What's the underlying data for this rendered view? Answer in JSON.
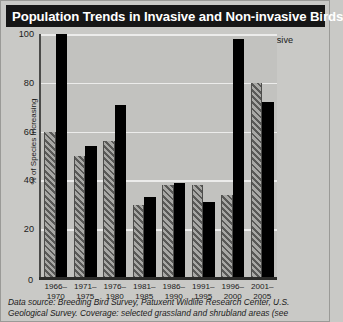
{
  "title": "Population Trends in Invasive and Non-invasive Birds",
  "legend": {
    "position": "top-right",
    "items": [
      {
        "label": "Non-invasive",
        "swatch": "hatched-gray-swatch"
      },
      {
        "label": "Invasive",
        "swatch": "solid-black-swatch"
      }
    ]
  },
  "axes": {
    "ylabel": "% of Species Increasing",
    "yticks": [
      "100",
      "80",
      "60",
      "40",
      "20"
    ],
    "zero_label": "0"
  },
  "footnote": {
    "line1": "Data source: Breeding Bird Survey, Patuxent Wildlife Research Center, U.S.",
    "line2": "Geological Survey. Coverage: selected grassland and shrubland areas (see"
  },
  "chart_data": {
    "type": "bar",
    "title": "Population Trends in Invasive and Non-invasive Birds",
    "xlabel": "",
    "ylabel": "% of Species Increasing",
    "ylim": [
      0,
      100
    ],
    "yticks": [
      0,
      20,
      40,
      60,
      80,
      100
    ],
    "grid": true,
    "legend_position": "top-right",
    "categories": [
      "1966–\n1970",
      "1971–\n1975",
      "1976–\n1980",
      "1981–\n1985",
      "1986–\n1990",
      "1991–\n1995",
      "1996–\n2000",
      "2001–\n2005"
    ],
    "categories_line1": [
      "1966–",
      "1971–",
      "1976–",
      "1981–",
      "1986–",
      "1991–",
      "1996–",
      "2001–"
    ],
    "categories_line2": [
      "1970",
      "1975",
      "1980",
      "1985",
      "1990",
      "1995",
      "2000",
      "2005"
    ],
    "series": [
      {
        "name": "Non-invasive",
        "color": "#6f6f6d",
        "pattern": "diagonal-hatch",
        "values": [
          60,
          50,
          56,
          30,
          38,
          38,
          34,
          80
        ]
      },
      {
        "name": "Invasive",
        "color": "#000000",
        "pattern": "solid",
        "values": [
          100,
          54,
          71,
          33,
          39,
          31,
          98,
          72
        ]
      }
    ]
  },
  "colors": {
    "title_bar": "#161616",
    "title_text": "#ffffff",
    "page_background": "#c9c9c6",
    "plot_background": "#c2c2bf",
    "gridline": "#ececeb",
    "axis": "#2b2b29"
  }
}
